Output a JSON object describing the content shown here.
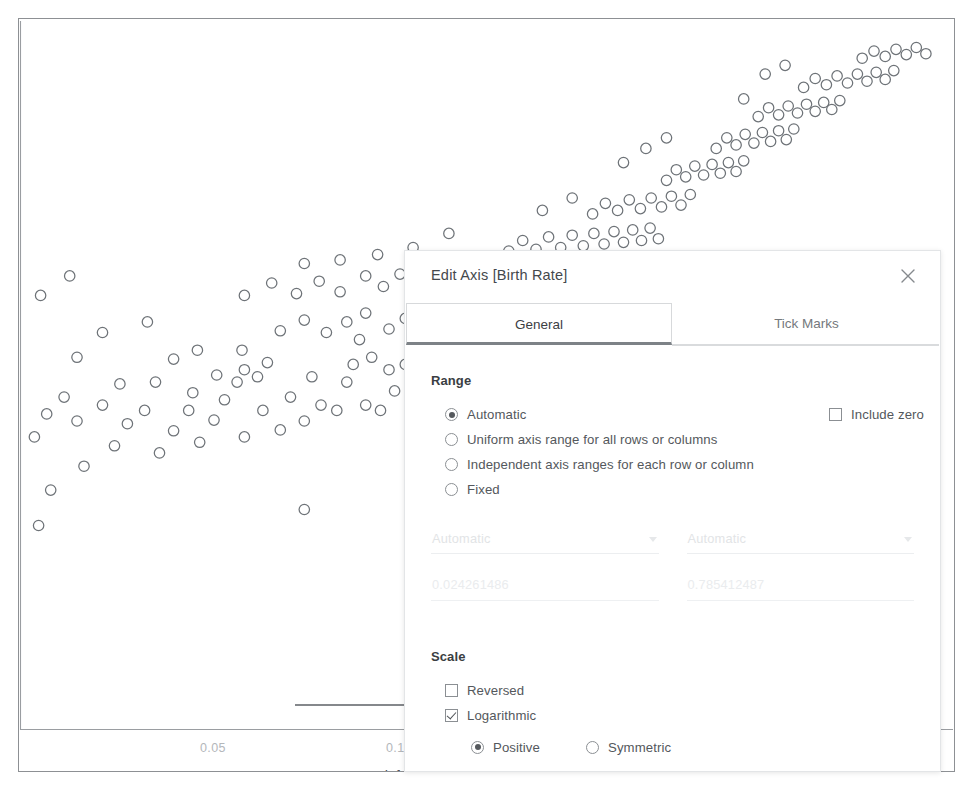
{
  "chart_data": {
    "type": "scatter",
    "title": "",
    "xlabel": "Infant Mortality Rate",
    "ylabel": "Birth Rate",
    "xscale": "log",
    "yscale": "linear",
    "xticks": [
      "0.05",
      "0.1",
      "0.2",
      "0.5"
    ],
    "xtick_values": [
      0.05,
      0.1,
      0.2,
      0.5
    ],
    "xlim": [
      0.024261486,
      0.785412487
    ],
    "grid": false,
    "legend": null,
    "marker": "open-circle",
    "marker_color": "#6e7378",
    "points": [
      [
        0.0272,
        0.47
      ],
      [
        0.0308,
        0.497
      ],
      [
        0.0256,
        0.53
      ],
      [
        0.03,
        0.548
      ],
      [
        0.0268,
        0.556
      ],
      [
        0.0345,
        0.52
      ],
      [
        0.0362,
        0.545
      ],
      [
        0.033,
        0.566
      ],
      [
        0.0286,
        0.575
      ],
      [
        0.0408,
        0.512
      ],
      [
        0.043,
        0.537
      ],
      [
        0.0386,
        0.56
      ],
      [
        0.0455,
        0.56
      ],
      [
        0.0352,
        0.59
      ],
      [
        0.0402,
        0.592
      ],
      [
        0.0474,
        0.524
      ],
      [
        0.05,
        0.549
      ],
      [
        0.0462,
        0.58
      ],
      [
        0.052,
        0.572
      ],
      [
        0.056,
        0.53
      ],
      [
        0.0545,
        0.592
      ],
      [
        0.06,
        0.56
      ],
      [
        0.0588,
        0.598
      ],
      [
        0.064,
        0.538
      ],
      [
        0.0665,
        0.575
      ],
      [
        0.03,
        0.62
      ],
      [
        0.033,
        0.648
      ],
      [
        0.0262,
        0.69
      ],
      [
        0.0292,
        0.712
      ],
      [
        0.056,
        0.606
      ],
      [
        0.061,
        0.614
      ],
      [
        0.07,
        0.548
      ],
      [
        0.0745,
        0.566
      ],
      [
        0.079,
        0.56
      ],
      [
        0.072,
        0.598
      ],
      [
        0.082,
        0.592
      ],
      [
        0.088,
        0.566
      ],
      [
        0.093,
        0.56
      ],
      [
        0.098,
        0.582
      ],
      [
        0.104,
        0.572
      ],
      [
        0.043,
        0.618
      ],
      [
        0.047,
        0.628
      ],
      [
        0.039,
        0.66
      ],
      [
        0.0505,
        0.6
      ],
      [
        0.0555,
        0.628
      ],
      [
        0.084,
        0.612
      ],
      [
        0.09,
        0.62
      ],
      [
        0.086,
        0.64
      ],
      [
        0.096,
        0.606
      ],
      [
        0.102,
        0.612
      ],
      [
        0.11,
        0.562
      ],
      [
        0.118,
        0.576
      ],
      [
        0.125,
        0.556
      ],
      [
        0.132,
        0.582
      ],
      [
        0.14,
        0.566
      ],
      [
        0.115,
        0.606
      ],
      [
        0.122,
        0.62
      ],
      [
        0.13,
        0.612
      ],
      [
        0.138,
        0.6
      ],
      [
        0.145,
        0.618
      ],
      [
        0.064,
        0.65
      ],
      [
        0.07,
        0.662
      ],
      [
        0.076,
        0.648
      ],
      [
        0.082,
        0.66
      ],
      [
        0.088,
        0.67
      ],
      [
        0.096,
        0.652
      ],
      [
        0.102,
        0.664
      ],
      [
        0.11,
        0.648
      ],
      [
        0.118,
        0.66
      ],
      [
        0.124,
        0.672
      ],
      [
        0.132,
        0.65
      ],
      [
        0.14,
        0.664
      ],
      [
        0.148,
        0.646
      ],
      [
        0.156,
        0.658
      ],
      [
        0.164,
        0.672
      ],
      [
        0.056,
        0.69
      ],
      [
        0.062,
        0.704
      ],
      [
        0.068,
        0.692
      ],
      [
        0.074,
        0.706
      ],
      [
        0.08,
        0.694
      ],
      [
        0.088,
        0.712
      ],
      [
        0.094,
        0.7
      ],
      [
        0.1,
        0.714
      ],
      [
        0.108,
        0.702
      ],
      [
        0.116,
        0.716
      ],
      [
        0.124,
        0.704
      ],
      [
        0.13,
        0.718
      ],
      [
        0.138,
        0.706
      ],
      [
        0.146,
        0.72
      ],
      [
        0.154,
        0.708
      ],
      [
        0.162,
        0.722
      ],
      [
        0.17,
        0.71
      ],
      [
        0.178,
        0.724
      ],
      [
        0.186,
        0.712
      ],
      [
        0.194,
        0.726
      ],
      [
        0.15,
        0.74
      ],
      [
        0.158,
        0.752
      ],
      [
        0.166,
        0.742
      ],
      [
        0.174,
        0.756
      ],
      [
        0.182,
        0.744
      ],
      [
        0.19,
        0.758
      ],
      [
        0.198,
        0.746
      ],
      [
        0.206,
        0.76
      ],
      [
        0.214,
        0.748
      ],
      [
        0.222,
        0.762
      ],
      [
        0.23,
        0.75
      ],
      [
        0.238,
        0.764
      ],
      [
        0.246,
        0.752
      ],
      [
        0.254,
        0.766
      ],
      [
        0.262,
        0.754
      ],
      [
        0.205,
        0.782
      ],
      [
        0.215,
        0.794
      ],
      [
        0.225,
        0.786
      ],
      [
        0.235,
        0.798
      ],
      [
        0.245,
        0.788
      ],
      [
        0.255,
        0.8
      ],
      [
        0.265,
        0.79
      ],
      [
        0.275,
        0.802
      ],
      [
        0.285,
        0.792
      ],
      [
        0.295,
        0.804
      ],
      [
        0.27,
        0.82
      ],
      [
        0.28,
        0.832
      ],
      [
        0.29,
        0.824
      ],
      [
        0.3,
        0.836
      ],
      [
        0.31,
        0.826
      ],
      [
        0.32,
        0.838
      ],
      [
        0.33,
        0.828
      ],
      [
        0.34,
        0.84
      ],
      [
        0.35,
        0.83
      ],
      [
        0.36,
        0.842
      ],
      [
        0.325,
        0.856
      ],
      [
        0.338,
        0.868
      ],
      [
        0.35,
        0.86
      ],
      [
        0.362,
        0.872
      ],
      [
        0.374,
        0.862
      ],
      [
        0.386,
        0.874
      ],
      [
        0.398,
        0.864
      ],
      [
        0.41,
        0.876
      ],
      [
        0.422,
        0.866
      ],
      [
        0.434,
        0.878
      ],
      [
        0.38,
        0.892
      ],
      [
        0.395,
        0.902
      ],
      [
        0.41,
        0.894
      ],
      [
        0.425,
        0.904
      ],
      [
        0.44,
        0.896
      ],
      [
        0.455,
        0.906
      ],
      [
        0.47,
        0.898
      ],
      [
        0.485,
        0.908
      ],
      [
        0.5,
        0.9
      ],
      [
        0.515,
        0.91
      ],
      [
        0.45,
        0.925
      ],
      [
        0.47,
        0.935
      ],
      [
        0.49,
        0.928
      ],
      [
        0.51,
        0.938
      ],
      [
        0.53,
        0.93
      ],
      [
        0.55,
        0.94
      ],
      [
        0.57,
        0.932
      ],
      [
        0.59,
        0.942
      ],
      [
        0.61,
        0.934
      ],
      [
        0.63,
        0.944
      ],
      [
        0.56,
        0.958
      ],
      [
        0.585,
        0.966
      ],
      [
        0.61,
        0.96
      ],
      [
        0.635,
        0.968
      ],
      [
        0.66,
        0.962
      ],
      [
        0.685,
        0.97
      ],
      [
        0.71,
        0.963
      ],
      [
        0.42,
        0.95
      ],
      [
        0.39,
        0.94
      ],
      [
        0.36,
        0.912
      ],
      [
        0.23,
        0.84
      ],
      [
        0.25,
        0.856
      ],
      [
        0.27,
        0.868
      ],
      [
        0.19,
        0.8
      ],
      [
        0.17,
        0.786
      ],
      [
        0.12,
        0.76
      ],
      [
        0.105,
        0.744
      ],
      [
        0.092,
        0.736
      ],
      [
        0.08,
        0.73
      ],
      [
        0.07,
        0.726
      ],
      [
        0.135,
        0.3
      ],
      [
        0.128,
        0.23
      ],
      [
        0.026,
        0.43
      ],
      [
        0.07,
        0.448
      ],
      [
        0.23,
        0.52
      ]
    ]
  },
  "dialog": {
    "title": "Edit Axis [Birth Rate]",
    "close_icon": "close-icon",
    "tabs": [
      {
        "label": "General",
        "active": true
      },
      {
        "label": "Tick Marks",
        "active": false
      }
    ],
    "range": {
      "section_label": "Range",
      "options": [
        {
          "label": "Automatic",
          "selected": true
        },
        {
          "label": "Uniform axis range for all rows or columns",
          "selected": false
        },
        {
          "label": "Independent axis ranges for each row or column",
          "selected": false
        },
        {
          "label": "Fixed",
          "selected": false
        }
      ],
      "include_zero": {
        "label": "Include zero",
        "checked": false
      },
      "start": {
        "mode": "Automatic",
        "value": "0.024261486",
        "disabled": true
      },
      "end": {
        "mode": "Automatic",
        "value": "0.785412487",
        "disabled": true
      }
    },
    "scale": {
      "section_label": "Scale",
      "reversed": {
        "label": "Reversed",
        "checked": false
      },
      "logarithmic": {
        "label": "Logarithmic",
        "checked": true
      },
      "log_types": [
        {
          "label": "Positive",
          "selected": true
        },
        {
          "label": "Symmetric",
          "selected": false
        }
      ]
    }
  },
  "annotations": [
    {
      "name": "arrow-to-include-zero",
      "target": "Include zero"
    },
    {
      "name": "arrow-to-logarithmic",
      "target": "Logarithmic"
    }
  ],
  "colors": {
    "marker_stroke": "#6e7378",
    "axis": "#9a9da1",
    "text": "#54585c",
    "tab_underline": "#7d8287"
  }
}
